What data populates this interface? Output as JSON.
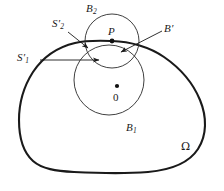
{
  "figure": {
    "kind": "geometry-diagram",
    "width": 224,
    "height": 191,
    "background_color": "#ffffff",
    "stroke_color": "#1a1a1a",
    "labels": {
      "domain": "Ω",
      "outer_ball": "B",
      "outer_ball_sub": "1",
      "inner_ball": "B",
      "inner_ball_sub": "2",
      "ball_prime": "B",
      "ball_prime_mark": "′",
      "point_p": "P",
      "origin": "0",
      "sphere1": "S",
      "sphere1_mark": "′",
      "sphere1_sub": "1",
      "sphere2": "S",
      "sphere2_mark": "′",
      "sphere2_sub": "2"
    },
    "elements": {
      "omega_boundary": "closed-blob-curve",
      "circle_b1": {
        "cx": 109,
        "cy": 80,
        "r": 35
      },
      "circle_b2": {
        "cx": 112,
        "cy": 41,
        "r": 27
      },
      "point_p_dot": {
        "cx": 112,
        "cy": 41
      },
      "origin_dot": {
        "cx": 117,
        "cy": 86
      }
    }
  }
}
